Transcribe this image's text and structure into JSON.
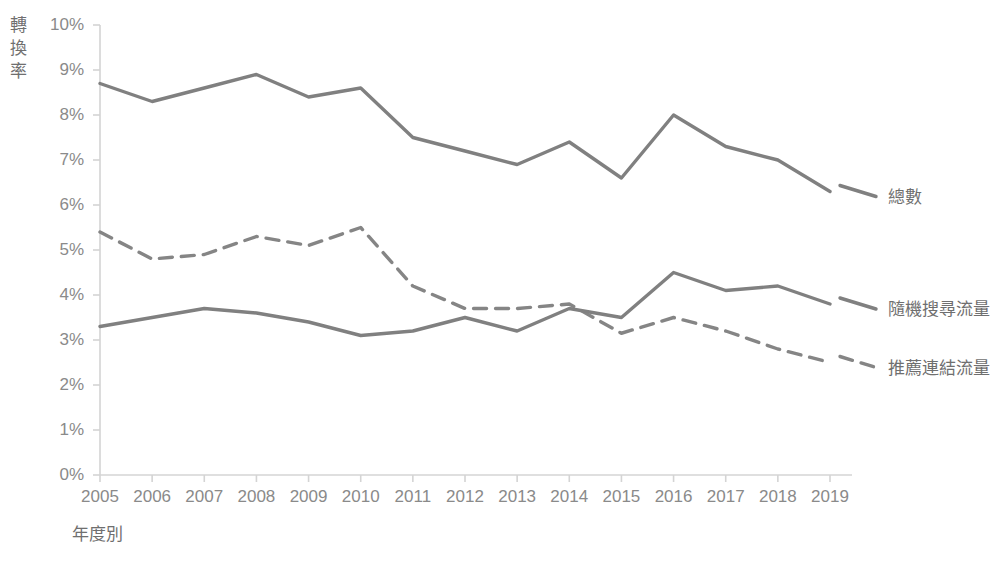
{
  "chart_data": {
    "type": "line",
    "title": "",
    "xlabel": "年度別",
    "ylabel": "轉換率",
    "categories": [
      "2005",
      "2006",
      "2007",
      "2008",
      "2009",
      "2010",
      "2011",
      "2012",
      "2013",
      "2014",
      "2015",
      "2016",
      "2017",
      "2018",
      "2019"
    ],
    "x": [
      2005,
      2006,
      2007,
      2008,
      2009,
      2010,
      2011,
      2012,
      2013,
      2014,
      2015,
      2016,
      2017,
      2018,
      2019
    ],
    "ylim": [
      0,
      10
    ],
    "yticks": [
      0,
      1,
      2,
      3,
      4,
      5,
      6,
      7,
      8,
      9,
      10
    ],
    "ytick_labels": [
      "0%",
      "1%",
      "2%",
      "3%",
      "4%",
      "5%",
      "6%",
      "7%",
      "8%",
      "9%",
      "10%"
    ],
    "grid": false,
    "legend_position": "right-inline",
    "series": [
      {
        "name": "總數",
        "style": "solid",
        "color": "#808080",
        "values": [
          8.7,
          8.3,
          8.6,
          8.9,
          8.4,
          8.6,
          7.5,
          7.2,
          6.9,
          7.4,
          6.6,
          8.0,
          7.3,
          7.0,
          6.3
        ]
      },
      {
        "name": "推薦連結流量",
        "style": "dashed",
        "color": "#858585",
        "values": [
          5.4,
          4.8,
          4.9,
          5.3,
          5.1,
          5.5,
          4.2,
          3.7,
          3.7,
          3.8,
          3.15,
          3.5,
          3.2,
          2.8,
          2.5
        ]
      },
      {
        "name": "隨機搜尋流量",
        "style": "solid",
        "color": "#808080",
        "values": [
          3.3,
          3.5,
          3.7,
          3.6,
          3.4,
          3.1,
          3.2,
          3.5,
          3.2,
          3.7,
          3.5,
          4.5,
          4.1,
          4.2,
          3.8
        ]
      }
    ]
  },
  "axes": {
    "y_title_chars": [
      "轉",
      "換",
      "率"
    ],
    "x_title": "年度別"
  },
  "legend": {
    "entries": [
      {
        "label": "總數",
        "series_index": 0
      },
      {
        "label": "隨機搜尋流量",
        "series_index": 2
      },
      {
        "label": "推薦連結流量",
        "series_index": 1
      }
    ]
  },
  "colors": {
    "line": "#808080",
    "axis": "#d4d4d4",
    "tick_text": "#8a8a8a",
    "title_text": "#6f6f6f",
    "background": "#ffffff"
  }
}
